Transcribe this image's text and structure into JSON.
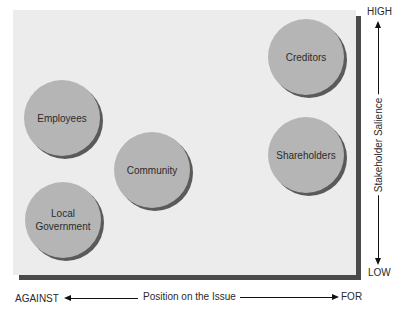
{
  "diagram": {
    "y_axis": {
      "label": "Stakeholder Salience",
      "high_label": "HIGH",
      "low_label": "LOW"
    },
    "x_axis": {
      "label": "Position on the Issue",
      "left_label": "AGAINST",
      "right_label": "FOR"
    },
    "stakeholders": [
      {
        "name": "Creditors",
        "position": "for",
        "salience": "high"
      },
      {
        "name": "Employees",
        "position": "against",
        "salience": "medium-high"
      },
      {
        "name": "Community",
        "position": "neutral-against",
        "salience": "medium"
      },
      {
        "name": "Shareholders",
        "position": "for",
        "salience": "medium"
      },
      {
        "name": "Local\nGovernment",
        "position": "against",
        "salience": "medium-low"
      }
    ],
    "colors": {
      "panel": "#ececec",
      "panel_shadow": "#4a4a4a",
      "bubble": "#b5b5b5",
      "bubble_shadow": "#5a5a5a"
    }
  }
}
